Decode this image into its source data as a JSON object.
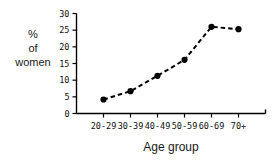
{
  "chart_data": {
    "type": "line",
    "title": "",
    "subtitle": "",
    "xlabel": "Age group",
    "ylabel": "% of women",
    "ylabel_lines": [
      "%",
      "of",
      "women"
    ],
    "categories": [
      "20-29",
      "30-39",
      "40-49",
      "50-59",
      "60-69",
      "70+"
    ],
    "values": [
      4.2,
      6.7,
      11.3,
      16.1,
      26.0,
      25.3
    ],
    "series": [
      {
        "name": "% of women",
        "values": [
          4.2,
          6.7,
          11.3,
          16.1,
          26.0,
          25.3
        ]
      }
    ],
    "ylim": [
      0,
      30
    ],
    "yticks": [
      0,
      5,
      10,
      15,
      20,
      25,
      30
    ],
    "ytick_labels": [
      "0",
      "5",
      "10",
      "15",
      "20",
      "25",
      "30"
    ],
    "grid": false,
    "legend": "none",
    "line_style": "dashed",
    "marker": "filled-circle",
    "line_color": "#000000",
    "marker_color": "#000000",
    "axis_color": "#000000",
    "background_color": "#ffffff"
  }
}
